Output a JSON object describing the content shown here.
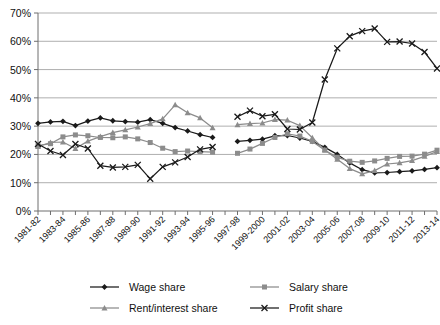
{
  "chart_data": {
    "type": "line",
    "title": "",
    "subtitle": "",
    "xlabel": "",
    "ylabel": "",
    "ylim": [
      0,
      70
    ],
    "ytick_step": 10,
    "ytick_labels": [
      "0%",
      "10%",
      "20%",
      "30%",
      "40%",
      "50%",
      "60%",
      "70%"
    ],
    "ytick_values": [
      0,
      10,
      20,
      30,
      40,
      50,
      60,
      70
    ],
    "grid": true,
    "grid_axis": "y",
    "legend_position": "bottom",
    "x": [
      "1981-82",
      "1982-83",
      "1983-84",
      "1984-85",
      "1985-86",
      "1986-87",
      "1987-88",
      "1988-89",
      "1989-90",
      "1990-91",
      "1991-92",
      "1992-93",
      "1993-94",
      "1994-95",
      "1995-96",
      "1996-97",
      "1997-98",
      "1998-99",
      "1999-2000",
      "2000-01",
      "2001-02",
      "2002-03",
      "2003-04",
      "2004-05",
      "2005-06",
      "2006-07",
      "2007-08",
      "2008-09",
      "2009-10",
      "2010-11",
      "2011-12",
      "2012-13",
      "2013-14"
    ],
    "xtick_labels": [
      "1981-82",
      "1983-84",
      "1985-86",
      "1987-88",
      "1989-90",
      "1991-92",
      "1993-94",
      "1995-96",
      "1997-98",
      "1999-2000",
      "2001-02",
      "2003-04",
      "2005-06",
      "2007-08",
      "2009-10",
      "2011-12",
      "2013-14"
    ],
    "xtick_label_interval": 2,
    "data_gap_after": "1995-96",
    "series": [
      {
        "name": "Wage share",
        "marker": "diamond",
        "color": "#1a1a1a",
        "values": [
          31.0,
          31.5,
          31.7,
          30.2,
          31.8,
          32.9,
          31.9,
          31.6,
          31.4,
          32.3,
          31.0,
          29.5,
          28.3,
          27.0,
          26.0,
          null,
          24.6,
          25.0,
          25.4,
          26.6,
          26.7,
          25.8,
          24.6,
          22.5,
          20.0,
          17.0,
          14.6,
          13.5,
          13.6,
          13.9,
          14.2,
          14.7,
          15.3
        ]
      },
      {
        "name": "Salary share",
        "marker": "square",
        "color": "#8c8c8c",
        "values": [
          23.1,
          23.8,
          26.2,
          26.9,
          26.6,
          26.0,
          25.9,
          26.2,
          25.5,
          24.2,
          22.2,
          21.0,
          21.2,
          21.0,
          20.8,
          null,
          20.4,
          21.9,
          23.9,
          26.0,
          27.3,
          26.5,
          24.6,
          21.5,
          19.0,
          17.6,
          17.2,
          17.7,
          18.6,
          19.3,
          19.4,
          20.1,
          21.5
        ]
      },
      {
        "name": "Rent/interest share",
        "marker": "triangle",
        "color": "#8c8c8c",
        "values": [
          22.8,
          24.2,
          24.4,
          22.1,
          24.7,
          26.3,
          27.7,
          28.7,
          29.7,
          30.9,
          32.6,
          37.5,
          34.7,
          32.9,
          29.4,
          null,
          30.5,
          30.9,
          31.1,
          32.3,
          32.1,
          30.2,
          25.9,
          21.6,
          18.3,
          15.0,
          13.1,
          14.3,
          16.6,
          17.0,
          17.8,
          19.3,
          21.0
        ]
      },
      {
        "name": "Profit share",
        "marker": "cross",
        "color": "#1a1a1a",
        "values": [
          23.7,
          21.2,
          19.8,
          23.7,
          22.1,
          16.0,
          15.4,
          15.6,
          16.3,
          11.4,
          15.6,
          17.2,
          19.1,
          21.8,
          22.6,
          null,
          33.3,
          35.5,
          33.5,
          34.2,
          29.0,
          28.8,
          31.3,
          46.5,
          57.5,
          61.8,
          63.6,
          64.5,
          59.8,
          59.9,
          59.2,
          56.2,
          50.4
        ]
      }
    ]
  },
  "legend": {
    "items": [
      {
        "label": "Wage share",
        "marker": "diamond",
        "color": "#1a1a1a"
      },
      {
        "label": "Salary share",
        "marker": "square",
        "color": "#8c8c8c"
      },
      {
        "label": "Rent/interest share",
        "marker": "triangle",
        "color": "#8c8c8c"
      },
      {
        "label": "Profit share",
        "marker": "cross",
        "color": "#1a1a1a"
      }
    ]
  },
  "axes": {
    "grid_color": "#a6a6a6",
    "axis_color": "#6e6e6e"
  }
}
